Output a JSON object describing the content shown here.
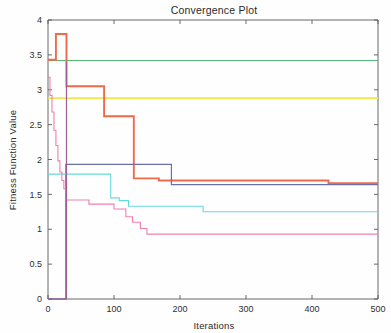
{
  "chart_data": {
    "type": "line",
    "title": "Convergence Plot",
    "xlabel": "Iterations",
    "ylabel": "Fitness Function Value",
    "xlim": [
      0,
      500
    ],
    "ylim": [
      0,
      4
    ],
    "grid": false,
    "legend": "none",
    "xticks": [
      "0",
      "100",
      "200",
      "300",
      "400",
      "500"
    ],
    "xtick_values": [
      0,
      100,
      200,
      300,
      400,
      500
    ],
    "yticks": [
      "0",
      "0.5",
      "1",
      "1.5",
      "2",
      "2.5",
      "3",
      "3.5",
      "4"
    ],
    "ytick_values": [
      0,
      0.5,
      1,
      1.5,
      2,
      2.5,
      3,
      3.5,
      4
    ],
    "series": [
      {
        "name": "green-flat",
        "color": "#4fb477",
        "width": 1.0,
        "points": [
          [
            0,
            3.42
          ],
          [
            500,
            3.42
          ]
        ]
      },
      {
        "name": "yellow-flat",
        "color": "#f2e64d",
        "width": 1.6,
        "points": [
          [
            0,
            2.88
          ],
          [
            500,
            2.88
          ]
        ]
      },
      {
        "name": "orange-stepped",
        "color": "#ef6a4a",
        "width": 1.9,
        "points": [
          [
            0,
            3.43
          ],
          [
            12,
            3.43
          ],
          [
            12,
            3.8
          ],
          [
            28,
            3.8
          ],
          [
            28,
            3.05
          ],
          [
            85,
            3.05
          ],
          [
            85,
            2.62
          ],
          [
            130,
            2.62
          ],
          [
            130,
            1.73
          ],
          [
            168,
            1.73
          ],
          [
            168,
            1.7
          ],
          [
            425,
            1.7
          ],
          [
            425,
            1.66
          ],
          [
            500,
            1.66
          ]
        ]
      },
      {
        "name": "navy-stepped",
        "color": "#6b6fa8",
        "width": 1.2,
        "points": [
          [
            0,
            0.0
          ],
          [
            27,
            0.0
          ],
          [
            27,
            1.93
          ],
          [
            187,
            1.93
          ],
          [
            187,
            1.64
          ],
          [
            500,
            1.64
          ]
        ]
      },
      {
        "name": "cyan-stepped",
        "color": "#66d9e0",
        "width": 1.1,
        "points": [
          [
            0,
            1.79
          ],
          [
            95,
            1.79
          ],
          [
            95,
            1.45
          ],
          [
            108,
            1.45
          ],
          [
            108,
            1.41
          ],
          [
            122,
            1.41
          ],
          [
            122,
            1.33
          ],
          [
            235,
            1.33
          ],
          [
            235,
            1.25
          ],
          [
            500,
            1.25
          ]
        ]
      },
      {
        "name": "magenta-stepped",
        "color": "#f07fae",
        "width": 1.1,
        "points": [
          [
            0,
            3.18
          ],
          [
            3,
            3.18
          ],
          [
            3,
            2.92
          ],
          [
            6,
            2.92
          ],
          [
            6,
            2.68
          ],
          [
            9,
            2.68
          ],
          [
            9,
            2.42
          ],
          [
            12,
            2.42
          ],
          [
            12,
            2.2
          ],
          [
            15,
            2.2
          ],
          [
            15,
            1.98
          ],
          [
            18,
            1.98
          ],
          [
            18,
            1.82
          ],
          [
            21,
            1.82
          ],
          [
            21,
            1.7
          ],
          [
            24,
            1.7
          ],
          [
            24,
            1.58
          ],
          [
            28,
            1.58
          ],
          [
            28,
            1.42
          ],
          [
            62,
            1.42
          ],
          [
            62,
            1.36
          ],
          [
            100,
            1.36
          ],
          [
            100,
            1.29
          ],
          [
            118,
            1.29
          ],
          [
            118,
            1.18
          ],
          [
            128,
            1.18
          ],
          [
            128,
            1.1
          ],
          [
            140,
            1.1
          ],
          [
            140,
            1.01
          ],
          [
            150,
            1.01
          ],
          [
            150,
            0.93
          ],
          [
            500,
            0.93
          ]
        ]
      },
      {
        "name": "purple-zero",
        "color": "#9b5f93",
        "width": 1.2,
        "points": [
          [
            0,
            0.0
          ],
          [
            28,
            0.0
          ],
          [
            28,
            3.4
          ],
          [
            28,
            3.4
          ]
        ]
      }
    ]
  },
  "figure": {
    "background": "#fefefe",
    "axis_color": "#5a5a5a",
    "text_color": "#2b2b2b"
  }
}
